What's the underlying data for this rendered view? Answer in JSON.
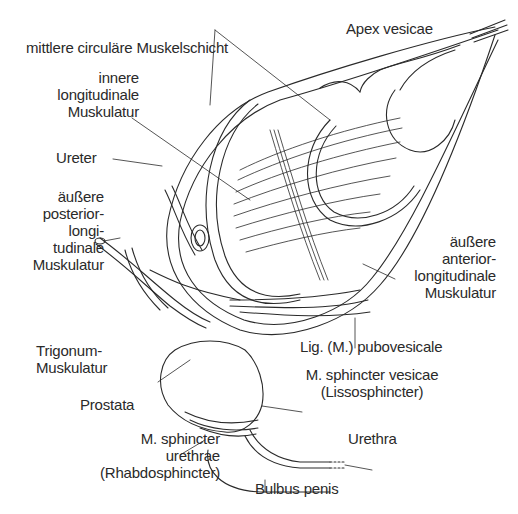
{
  "figure": {
    "labels": {
      "mittlere": "mittlere  circuläre Muskelschicht",
      "apex": "Apex vesicae",
      "innere": [
        "innere",
        "longitudinale",
        "Muskulatur"
      ],
      "ureter": "Ureter",
      "posterior": [
        "äußere",
        "posterior-",
        "longi-",
        "tudinale",
        "Muskulatur"
      ],
      "anterior": [
        "äußere",
        "anterior-",
        "longitudinale",
        "Muskulatur"
      ],
      "trigonum": [
        "Trigonum-",
        "Muskulatur"
      ],
      "lig": "Lig. (M.) pubovesicale",
      "sphincter_vesicae": [
        "M. sphincter vesicae",
        "(Lissosphincter)"
      ],
      "prostata": "Prostata",
      "urethra": "Urethra",
      "sphincter_urethrae": [
        "M. sphincter",
        "urethrae",
        "(Rhabdosphincter)"
      ],
      "bulbus": "Bulbus penis"
    },
    "colors": {
      "ink": "#2a2a2a",
      "background": "#ffffff"
    }
  }
}
